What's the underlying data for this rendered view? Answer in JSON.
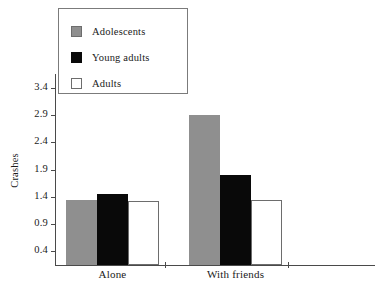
{
  "chart_data": {
    "type": "bar",
    "title": "",
    "xlabel": "",
    "ylabel": "Crashes",
    "categories": [
      "Alone",
      "With friends"
    ],
    "series": [
      {
        "name": "Adolescents",
        "color": "#8f8f8f",
        "values": [
          1.35,
          2.9
        ]
      },
      {
        "name": "Young adults",
        "color": "#090909",
        "values": [
          1.45,
          1.8
        ]
      },
      {
        "name": "Adults",
        "color": "#ffffff",
        "values": [
          1.32,
          1.35
        ]
      }
    ],
    "ylim": [
      0.15,
      3.65
    ],
    "yticks": [
      0.4,
      0.9,
      1.4,
      1.9,
      2.4,
      2.9,
      3.4
    ],
    "ytick_labels": [
      "0.4",
      "0.9",
      "1.4",
      "1.9",
      "2.4",
      "2.9",
      "3.4"
    ],
    "grid": false,
    "legend_position": "top-left"
  },
  "legend": {
    "items": [
      {
        "label": "Adolescents",
        "swatch": "adolescents"
      },
      {
        "label": "Young adults",
        "swatch": "young"
      },
      {
        "label": "Adults",
        "swatch": "adults"
      }
    ]
  },
  "axes": {
    "y_title": "Crashes",
    "y_labels": [
      "3.4",
      "2.9",
      "2.4",
      "1.9",
      "1.4",
      "0.9",
      "0.4"
    ],
    "x_labels": [
      "Alone",
      "With friends"
    ]
  }
}
